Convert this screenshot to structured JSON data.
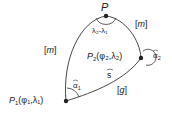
{
  "diagram": {
    "points": {
      "pole": {
        "label": "P"
      },
      "p1": {
        "label": "P",
        "sub": "1",
        "coords": "(φ₁,λ₁)"
      },
      "p2": {
        "label": "P",
        "sub": "2",
        "coords": "(φ₂,λ₂)"
      }
    },
    "labels": {
      "meridian_left": "[m]",
      "meridian_right": "[m]",
      "geodesic": "[g]",
      "arc_s": "s",
      "angle_pole": "λ₂-λ₁",
      "alpha1": "α",
      "alpha1_sub": "1",
      "alpha2": "α",
      "alpha2_sub": "2"
    },
    "colors": {
      "stroke": "#333333",
      "text": "#222222"
    }
  }
}
